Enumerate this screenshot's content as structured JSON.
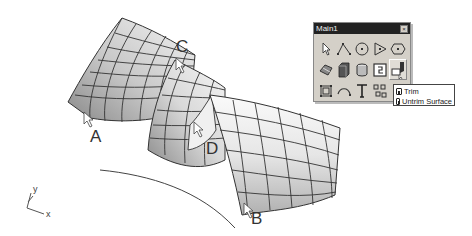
{
  "viewport": {
    "callouts": {
      "a": "A",
      "b": "B",
      "c": "C",
      "d": "D"
    },
    "axis": {
      "x": "x",
      "y": "y"
    }
  },
  "toolbar": {
    "title": "Main1",
    "close_label": "×",
    "icons": [
      "select-arrow-icon",
      "polyline-icon",
      "circle-icon",
      "polygon-icon",
      "ellipse-icon",
      "surface-patch-icon",
      "box-solid-icon",
      "cylinder-solid-icon",
      "mesh-icon",
      "trim-icon",
      "transform-box-icon",
      "arc-icon",
      "text-icon",
      "point-grid-icon"
    ]
  },
  "flyout": {
    "items": [
      {
        "label": "Trim",
        "icon": "trim-small-icon"
      },
      {
        "label": "Untrim Surface",
        "icon": "untrim-small-icon"
      }
    ]
  }
}
